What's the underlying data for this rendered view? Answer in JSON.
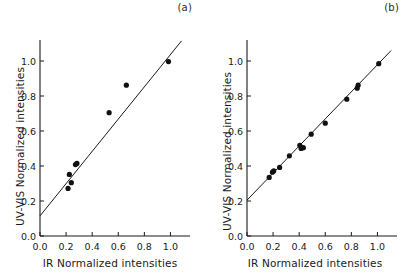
{
  "figure": {
    "background": "#ffffff",
    "ink_color": "#1a1a1a",
    "marker_color": "#111111"
  },
  "chart_data": [
    {
      "type": "scatter",
      "panel": "(a)",
      "title": "",
      "xlabel": "IR Normalized  intensities",
      "ylabel": "UV-VIS Normalized  intensities",
      "xlim": [
        0.0,
        1.15
      ],
      "ylim": [
        0.0,
        1.12
      ],
      "xticks": [
        0.0,
        0.2,
        0.4,
        0.6,
        0.8,
        1.0
      ],
      "xticklabels": [
        "0.0",
        "0.2",
        "0.4",
        "0.6",
        "0.8",
        "1.0"
      ],
      "yticks": [
        0.0,
        0.2,
        0.4,
        0.6,
        0.8,
        1.0
      ],
      "yticklabels": [
        "0.0",
        "0.2",
        "0.4",
        "0.6",
        "0.8",
        "1.0"
      ],
      "grid": false,
      "legend": "none",
      "points": [
        {
          "x": 0.215,
          "y": 0.272
        },
        {
          "x": 0.225,
          "y": 0.352
        },
        {
          "x": 0.24,
          "y": 0.305
        },
        {
          "x": 0.272,
          "y": 0.408
        },
        {
          "x": 0.283,
          "y": 0.415
        },
        {
          "x": 0.53,
          "y": 0.705
        },
        {
          "x": 0.662,
          "y": 0.862
        },
        {
          "x": 0.985,
          "y": 0.997
        }
      ],
      "fit_line": {
        "label": "linear fit",
        "x0": 0.0,
        "y0": 0.115,
        "x1": 1.085,
        "y1": 1.115
      }
    },
    {
      "type": "scatter",
      "panel": "(b)",
      "title": "",
      "xlabel": "IR Normalized  intensities",
      "ylabel": "UV-VIS Normalized  intensities",
      "xlim": [
        0.0,
        1.15
      ],
      "ylim": [
        0.0,
        1.12
      ],
      "xticks": [
        0.0,
        0.2,
        0.4,
        0.6,
        0.8,
        1.0
      ],
      "xticklabels": [
        "0.0",
        "0.2",
        "0.4",
        "0.6",
        "0.8",
        "1.0"
      ],
      "yticks": [
        0.0,
        0.2,
        0.4,
        0.6,
        0.8,
        1.0
      ],
      "yticklabels": [
        "0.0",
        "0.2",
        "0.4",
        "0.6",
        "0.8",
        "1.0"
      ],
      "grid": false,
      "legend": "none",
      "points": [
        {
          "x": 0.17,
          "y": 0.335
        },
        {
          "x": 0.195,
          "y": 0.365
        },
        {
          "x": 0.205,
          "y": 0.372
        },
        {
          "x": 0.25,
          "y": 0.392
        },
        {
          "x": 0.325,
          "y": 0.458
        },
        {
          "x": 0.405,
          "y": 0.518
        },
        {
          "x": 0.415,
          "y": 0.5
        },
        {
          "x": 0.432,
          "y": 0.505
        },
        {
          "x": 0.492,
          "y": 0.582
        },
        {
          "x": 0.6,
          "y": 0.645
        },
        {
          "x": 0.765,
          "y": 0.782
        },
        {
          "x": 0.845,
          "y": 0.845
        },
        {
          "x": 0.852,
          "y": 0.862
        },
        {
          "x": 1.01,
          "y": 0.985
        }
      ],
      "fit_line": {
        "label": "linear fit",
        "x0": 0.0,
        "y0": 0.205,
        "x1": 1.105,
        "y1": 1.06
      }
    }
  ]
}
